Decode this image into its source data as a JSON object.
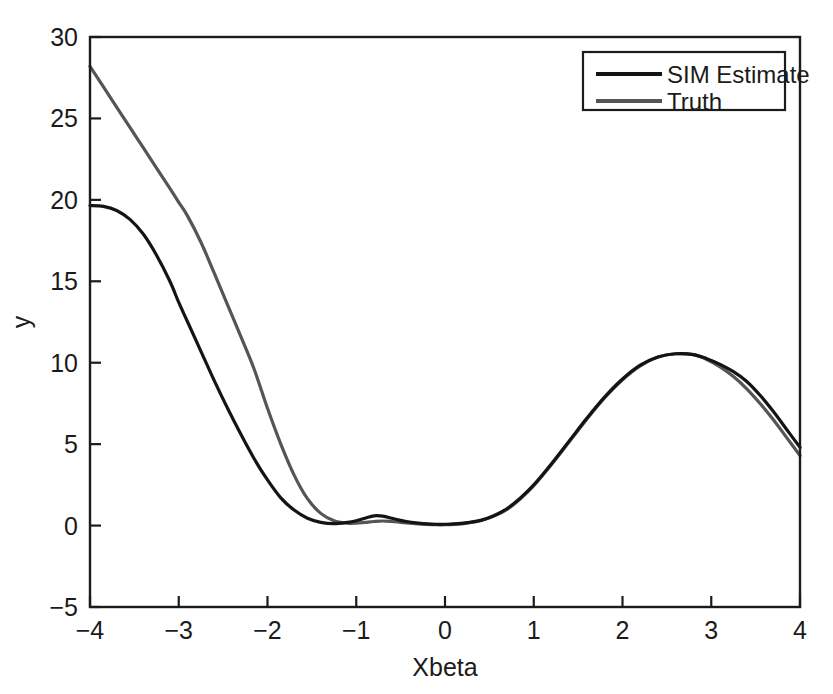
{
  "chart_data": {
    "type": "line",
    "title": "",
    "xlabel": "Xbeta",
    "ylabel": "y",
    "xlim": [
      -4,
      4
    ],
    "ylim": [
      -5,
      30
    ],
    "xticks": [
      -4,
      -3,
      -2,
      -1,
      0,
      1,
      2,
      3,
      4
    ],
    "xticklabels": [
      "−4",
      "−3",
      "−2",
      "−1",
      "0",
      "1",
      "2",
      "3",
      "4"
    ],
    "yticks": [
      -5,
      0,
      5,
      10,
      15,
      20,
      25,
      30
    ],
    "yticklabels": [
      "−5",
      "0",
      "5",
      "10",
      "15",
      "20",
      "25",
      "30"
    ],
    "grid": false,
    "legend_position": "upper right",
    "series": [
      {
        "name": "SIM Estimate",
        "color": "#141414",
        "linewidth": 3.2,
        "x": [
          -4.0,
          -3.85,
          -3.7,
          -3.55,
          -3.4,
          -3.25,
          -3.1,
          -3.0,
          -2.9,
          -2.75,
          -2.6,
          -2.45,
          -2.3,
          -2.15,
          -2.0,
          -1.85,
          -1.7,
          -1.55,
          -1.4,
          -1.25,
          -1.1,
          -1.0,
          -0.9,
          -0.8,
          -0.7,
          -0.6,
          -0.5,
          -0.4,
          -0.3,
          -0.2,
          -0.1,
          0.0,
          0.1,
          0.25,
          0.4,
          0.55,
          0.7,
          0.85,
          1.0,
          1.2,
          1.4,
          1.6,
          1.8,
          2.0,
          2.2,
          2.4,
          2.6,
          2.8,
          2.95,
          3.1,
          3.25,
          3.4,
          3.55,
          3.7,
          3.85,
          4.0
        ],
        "y": [
          19.65,
          19.6,
          19.35,
          18.8,
          17.9,
          16.6,
          15.0,
          13.7,
          12.5,
          10.7,
          8.9,
          7.2,
          5.6,
          4.1,
          2.8,
          1.7,
          0.95,
          0.45,
          0.2,
          0.12,
          0.2,
          0.3,
          0.45,
          0.6,
          0.58,
          0.45,
          0.32,
          0.22,
          0.15,
          0.1,
          0.08,
          0.08,
          0.1,
          0.18,
          0.32,
          0.6,
          1.05,
          1.7,
          2.5,
          3.8,
          5.2,
          6.6,
          7.9,
          9.0,
          9.85,
          10.35,
          10.55,
          10.5,
          10.25,
          9.9,
          9.45,
          8.85,
          8.0,
          7.0,
          5.9,
          4.8
        ]
      },
      {
        "name": "Truth",
        "color": "#555555",
        "linewidth": 3.2,
        "x": [
          -4.0,
          -3.85,
          -3.7,
          -3.55,
          -3.4,
          -3.25,
          -3.1,
          -3.0,
          -2.9,
          -2.75,
          -2.6,
          -2.45,
          -2.3,
          -2.15,
          -2.0,
          -1.85,
          -1.7,
          -1.55,
          -1.4,
          -1.25,
          -1.1,
          -1.0,
          -0.9,
          -0.8,
          -0.7,
          -0.6,
          -0.5,
          -0.4,
          -0.3,
          -0.2,
          -0.1,
          0.0,
          0.1,
          0.25,
          0.4,
          0.55,
          0.7,
          0.85,
          1.0,
          1.2,
          1.4,
          1.6,
          1.8,
          2.0,
          2.2,
          2.4,
          2.6,
          2.8,
          2.95,
          3.1,
          3.25,
          3.4,
          3.55,
          3.7,
          3.85,
          4.0
        ],
        "y": [
          28.2,
          26.95,
          25.7,
          24.45,
          23.2,
          21.95,
          20.7,
          19.85,
          19.0,
          17.4,
          15.5,
          13.55,
          11.6,
          9.6,
          7.2,
          5.0,
          3.1,
          1.65,
          0.75,
          0.3,
          0.15,
          0.15,
          0.2,
          0.25,
          0.28,
          0.25,
          0.2,
          0.15,
          0.1,
          0.07,
          0.05,
          0.05,
          0.07,
          0.15,
          0.3,
          0.58,
          1.0,
          1.65,
          2.45,
          3.75,
          5.15,
          6.55,
          7.85,
          8.95,
          9.8,
          10.35,
          10.55,
          10.5,
          10.2,
          9.75,
          9.15,
          8.4,
          7.5,
          6.5,
          5.4,
          4.3
        ]
      }
    ]
  },
  "legend": {
    "entries": [
      {
        "label": "SIM Estimate",
        "swatch_color": "#141414"
      },
      {
        "label": "Truth",
        "swatch_color": "#555555"
      }
    ]
  },
  "axes": {
    "frame_color": "#1b1b1b",
    "background": "#ffffff"
  }
}
